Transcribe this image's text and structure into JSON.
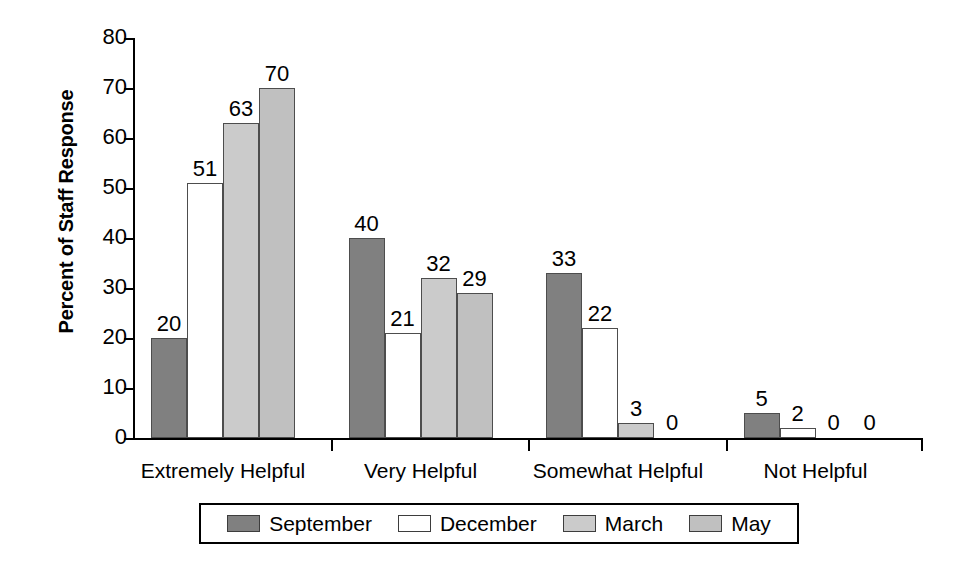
{
  "chart_data": {
    "type": "bar",
    "title": "",
    "subtitle": "",
    "xlabel": "",
    "ylabel": "Percent of Staff Response",
    "ylim": [
      0,
      80
    ],
    "yticks": [
      0,
      10,
      20,
      30,
      40,
      50,
      60,
      70,
      80
    ],
    "grid": false,
    "legend_position": "bottom",
    "categories": [
      "Extremely Helpful",
      "Very Helpful",
      "Somewhat Helpful",
      "Not Helpful"
    ],
    "series": [
      {
        "name": "September",
        "color": "#808080",
        "values": [
          20,
          40,
          33,
          5
        ]
      },
      {
        "name": "December",
        "color": "#ffffff",
        "values": [
          51,
          21,
          22,
          2
        ]
      },
      {
        "name": "March",
        "color": "#cbcbcb",
        "values": [
          63,
          32,
          3,
          0
        ]
      },
      {
        "name": "May",
        "color": "#c0c0c0",
        "values": [
          70,
          29,
          0,
          0
        ]
      }
    ]
  },
  "legend": {
    "items": [
      {
        "label": "September",
        "color": "#808080"
      },
      {
        "label": "December",
        "color": "#ffffff"
      },
      {
        "label": "March",
        "color": "#cbcbcb"
      },
      {
        "label": "May",
        "color": "#c0c0c0"
      }
    ]
  },
  "axis": {
    "y_title": "Percent of Staff Response",
    "y_tick_labels": [
      "0",
      "10",
      "20",
      "30",
      "40",
      "50",
      "60",
      "70",
      "80"
    ],
    "x_tick_labels": [
      "Extremely Helpful",
      "Very Helpful",
      "Somewhat Helpful",
      "Not Helpful"
    ]
  }
}
